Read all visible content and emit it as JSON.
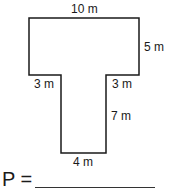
{
  "figure": {
    "shape": "T-shaped polygon",
    "stroke_color": "#1a1a1a",
    "labels": {
      "top": "10 m",
      "right_top": "5 m",
      "left_step": "3 m",
      "right_step": "3 m",
      "stem_right": "7 m",
      "bottom": "4 m"
    }
  },
  "question": {
    "prompt": "P =",
    "answer": ""
  }
}
